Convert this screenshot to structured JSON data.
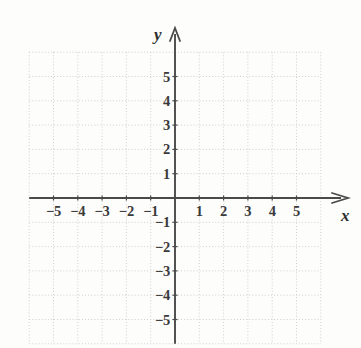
{
  "figure": {
    "kind": "cartesian-coordinate-grid",
    "background_color": "#fdfdfc",
    "axis_color": "#4a4a4a",
    "grid_color": "#cfcfcf",
    "label_color": "#3a3a3a"
  },
  "axes": {
    "x_axis_label": "x",
    "y_axis_label": "y",
    "x_arrow": "right",
    "y_arrow": "up"
  },
  "chart_data": {
    "type": "scatter",
    "title": "",
    "subtitle": "",
    "xlabel": "x",
    "ylabel": "y",
    "xlim": [
      -6,
      6
    ],
    "ylim": [
      -6,
      6
    ],
    "xticks": [
      -5,
      -4,
      -3,
      -2,
      -1,
      1,
      2,
      3,
      4,
      5
    ],
    "yticks": [
      5,
      4,
      3,
      2,
      1,
      -1,
      -2,
      -3,
      -4,
      -5
    ],
    "xtick_labels": [
      "−5",
      "−4",
      "−3",
      "−2",
      "−1",
      "1",
      "2",
      "3",
      "4",
      "5"
    ],
    "ytick_labels": [
      "5",
      "4",
      "3",
      "2",
      "1",
      "−1",
      "−2",
      "−3",
      "−4",
      "−5"
    ],
    "grid": true,
    "grid_style": "dotted",
    "grid_step": 1,
    "legend": null,
    "series": [],
    "annotations": [],
    "points": []
  }
}
